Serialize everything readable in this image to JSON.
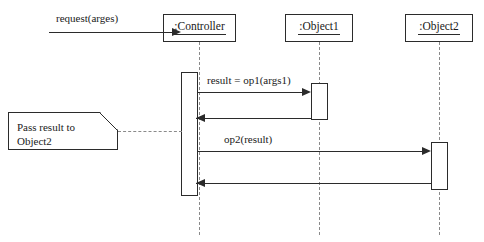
{
  "diagram": {
    "type": "uml-sequence-diagram",
    "colors": {
      "stroke": "#2b2b2b",
      "lifeline_dash": "#8a8a8a",
      "background": "#ffffff"
    },
    "participants": [
      {
        "id": "controller",
        "label": ":Controller"
      },
      {
        "id": "object1",
        "label": ":Object1"
      },
      {
        "id": "object2",
        "label": ":Object2"
      }
    ],
    "messages": [
      {
        "id": "request",
        "label": "request(arges)",
        "from": "actor",
        "to": "controller",
        "direction": "right",
        "kind": "call"
      },
      {
        "id": "op1",
        "label": "result = op1(args1)",
        "from": "controller",
        "to": "object1",
        "direction": "right",
        "kind": "call"
      },
      {
        "id": "op1-return",
        "label": "",
        "from": "object1",
        "to": "controller",
        "direction": "left",
        "kind": "return"
      },
      {
        "id": "op2",
        "label": "op2(result)",
        "from": "controller",
        "to": "object2",
        "direction": "right",
        "kind": "call"
      },
      {
        "id": "op2-return",
        "label": "",
        "from": "object2",
        "to": "controller",
        "direction": "left",
        "kind": "return"
      }
    ],
    "note": {
      "id": "note-pass-result",
      "text": "Pass result to\nObject2",
      "attached_to": "controller"
    }
  }
}
